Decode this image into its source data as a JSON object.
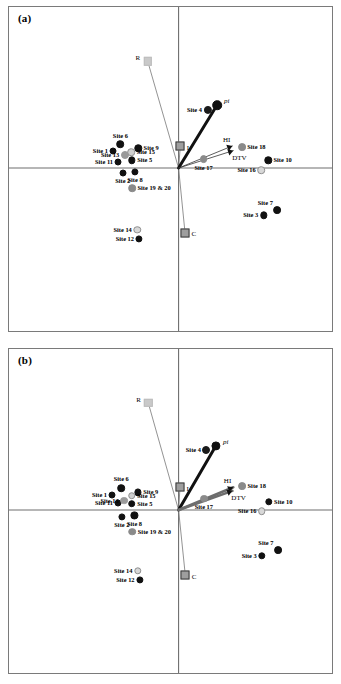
{
  "figure": {
    "type": "ordination-biplot-pair",
    "panels": [
      {
        "id": "a",
        "label": "(a)"
      },
      {
        "id": "b",
        "label": "(b)"
      }
    ]
  },
  "chart_data": [
    {
      "type": "scatter",
      "panel": "(a)",
      "title": "",
      "xlabel": "",
      "ylabel": "",
      "xlim": [
        -1,
        1
      ],
      "ylim": [
        -1,
        1
      ],
      "grid": false,
      "legend": "none",
      "axes": {
        "horizontal_axis_y": 0,
        "vertical_axis_x": 0,
        "cross_axes": true
      },
      "sites": [
        {
          "label": "Site 1",
          "x": -0.446,
          "y": 0.118,
          "fill": "#111111",
          "size": 7.0,
          "label_pos": "r"
        },
        {
          "label": "Site 2",
          "x": -0.38,
          "y": -0.032,
          "fill": "#111111",
          "size": 7.0,
          "label_pos": "below"
        },
        {
          "label": "Site 3",
          "x": 0.578,
          "y": -0.322,
          "fill": "#111111",
          "size": 7.4,
          "label_pos": "r"
        },
        {
          "label": "Site 4",
          "x": 0.198,
          "y": 0.392,
          "fill": "#1a1a1a",
          "size": 8.2,
          "label_pos": "r"
        },
        {
          "label": "Site 5",
          "x": -0.318,
          "y": 0.052,
          "fill": "#111111",
          "size": 7.4,
          "label_pos": "l"
        },
        {
          "label": "Site 6",
          "x": -0.396,
          "y": 0.16,
          "fill": "#111111",
          "size": 7.6,
          "label_pos": "above"
        },
        {
          "label": "Site 7",
          "x": 0.672,
          "y": -0.286,
          "fill": "#111111",
          "size": 7.8,
          "label_pos": "above-l"
        },
        {
          "label": "Site 8",
          "x": -0.296,
          "y": -0.026,
          "fill": "#111111",
          "size": 7.2,
          "label_pos": "below"
        },
        {
          "label": "Site 9",
          "x": -0.274,
          "y": 0.134,
          "fill": "#111111",
          "size": 7.4,
          "label_pos": "l"
        },
        {
          "label": "Site 10",
          "x": 0.61,
          "y": 0.052,
          "fill": "#111111",
          "size": 7.4,
          "label_pos": "l"
        },
        {
          "label": "Site 11",
          "x": -0.412,
          "y": 0.04,
          "fill": "#111111",
          "size": 7.0,
          "label_pos": "r"
        },
        {
          "label": "Site 12",
          "x": -0.268,
          "y": -0.48,
          "fill": "#111111",
          "size": 7.2,
          "label_pos": "r"
        },
        {
          "label": "Site 13",
          "x": -0.366,
          "y": 0.086,
          "fill": "#9a9a9a",
          "size": 8.0,
          "label_pos": "r"
        },
        {
          "label": "Site 14",
          "x": -0.282,
          "y": -0.42,
          "fill": "#d8d8d8",
          "size": 7.4,
          "label_pos": "r"
        },
        {
          "label": "Site 15",
          "x": -0.322,
          "y": 0.108,
          "fill": "#cfcfcf",
          "size": 7.6,
          "label_pos": "l"
        },
        {
          "label": "Site 16",
          "x": 0.562,
          "y": -0.014,
          "fill": "#d8d8d8",
          "size": 7.6,
          "label_pos": "r"
        },
        {
          "label": "Site 17",
          "x": 0.17,
          "y": 0.06,
          "fill": "#8a8a8a",
          "size": 7.8,
          "label_pos": "below"
        },
        {
          "label": "Site 18",
          "x": 0.43,
          "y": 0.142,
          "fill": "#8a8a8a",
          "size": 7.8,
          "label_pos": "l"
        },
        {
          "label": "Site 19 & 20",
          "x": -0.316,
          "y": -0.136,
          "fill": "#8a8a8a",
          "size": 7.6,
          "label_pos": "l"
        },
        {
          "label": "pi-site",
          "x": 0.262,
          "y": 0.428,
          "fill": "#111111",
          "size": 9.6,
          "label_pos": "none"
        }
      ],
      "vectors": [
        {
          "label": "R",
          "x": -0.21,
          "y": 0.724,
          "style": "thin-gray",
          "marker": "square-light",
          "label_pos": "l"
        },
        {
          "label": "I",
          "x": 0.012,
          "y": 0.148,
          "style": "thin-gray",
          "marker": "square-gray",
          "label_pos": "r"
        },
        {
          "label": "C",
          "x": 0.044,
          "y": -0.44,
          "style": "thin-gray",
          "marker": "square-gray",
          "label_pos": "r"
        },
        {
          "label": "pi",
          "x": 0.262,
          "y": 0.428,
          "style": "thick-black",
          "marker": "arrow",
          "label_pos": "r"
        },
        {
          "label": "HI",
          "x": 0.366,
          "y": 0.15,
          "style": "thin-black",
          "marker": "arrow",
          "label_pos": "above"
        },
        {
          "label": "DTV",
          "x": 0.372,
          "y": 0.118,
          "style": "thin-black",
          "marker": "arrow",
          "label_pos": "below-r"
        }
      ]
    },
    {
      "type": "scatter",
      "panel": "(b)",
      "title": "",
      "xlabel": "",
      "ylabel": "",
      "xlim": [
        -1,
        1
      ],
      "ylim": [
        -1,
        1
      ],
      "grid": false,
      "legend": "none",
      "axes": {
        "horizontal_axis_y": 0,
        "vertical_axis_x": 0,
        "cross_axes": true
      },
      "sites": [
        {
          "label": "Site 1",
          "x": -0.452,
          "y": 0.102,
          "fill": "#111111",
          "size": 7.0,
          "label_pos": "r"
        },
        {
          "label": "Site 2",
          "x": -0.386,
          "y": -0.046,
          "fill": "#111111",
          "size": 7.2,
          "label_pos": "below"
        },
        {
          "label": "Site 3",
          "x": 0.568,
          "y": -0.312,
          "fill": "#111111",
          "size": 7.4,
          "label_pos": "r"
        },
        {
          "label": "Site 4",
          "x": 0.19,
          "y": 0.41,
          "fill": "#1a1a1a",
          "size": 8.0,
          "label_pos": "r"
        },
        {
          "label": "Site 5",
          "x": -0.318,
          "y": 0.042,
          "fill": "#111111",
          "size": 7.6,
          "label_pos": "l"
        },
        {
          "label": "Site 6",
          "x": -0.39,
          "y": 0.15,
          "fill": "#111111",
          "size": 7.6,
          "label_pos": "above"
        },
        {
          "label": "Site 7",
          "x": 0.676,
          "y": -0.272,
          "fill": "#111111",
          "size": 7.8,
          "label_pos": "above-l"
        },
        {
          "label": "Site 8",
          "x": -0.3,
          "y": -0.036,
          "fill": "#111111",
          "size": 7.2,
          "label_pos": "below"
        },
        {
          "label": "Site 9",
          "x": -0.276,
          "y": 0.12,
          "fill": "#111111",
          "size": 7.2,
          "label_pos": "l"
        },
        {
          "label": "Site 10",
          "x": 0.614,
          "y": 0.056,
          "fill": "#111111",
          "size": 7.4,
          "label_pos": "l"
        },
        {
          "label": "Site 11",
          "x": -0.412,
          "y": 0.046,
          "fill": "#111111",
          "size": 7.0,
          "label_pos": "r"
        },
        {
          "label": "Site 12",
          "x": -0.264,
          "y": -0.472,
          "fill": "#111111",
          "size": 7.2,
          "label_pos": "r"
        },
        {
          "label": "Site 13",
          "x": -0.37,
          "y": 0.064,
          "fill": "#9a9a9a",
          "size": 7.8,
          "label_pos": "r"
        },
        {
          "label": "Site 14",
          "x": -0.278,
          "y": -0.414,
          "fill": "#d8d8d8",
          "size": 7.4,
          "label_pos": "r"
        },
        {
          "label": "Site 15",
          "x": -0.318,
          "y": 0.098,
          "fill": "#cfcfcf",
          "size": 7.6,
          "label_pos": "l"
        },
        {
          "label": "Site 16",
          "x": 0.566,
          "y": -0.008,
          "fill": "#d8d8d8",
          "size": 7.6,
          "label_pos": "r"
        },
        {
          "label": "Site 17",
          "x": 0.172,
          "y": 0.078,
          "fill": "#8a8a8a",
          "size": 7.8,
          "label_pos": "below"
        },
        {
          "label": "Site 18",
          "x": 0.432,
          "y": 0.16,
          "fill": "#8a8a8a",
          "size": 7.8,
          "label_pos": "l"
        },
        {
          "label": "Site 19 & 20",
          "x": -0.314,
          "y": -0.148,
          "fill": "#8a8a8a",
          "size": 7.6,
          "label_pos": "l"
        },
        {
          "label": "pi-site",
          "x": 0.254,
          "y": 0.436,
          "fill": "#111111",
          "size": 9.2,
          "label_pos": "none"
        }
      ],
      "vectors": [
        {
          "label": "R",
          "x": -0.206,
          "y": 0.726,
          "style": "thin-gray",
          "marker": "square-light",
          "label_pos": "l"
        },
        {
          "label": "I",
          "x": 0.01,
          "y": 0.156,
          "style": "thin-gray",
          "marker": "square-gray",
          "label_pos": "r"
        },
        {
          "label": "C",
          "x": 0.046,
          "y": -0.444,
          "style": "thin-gray",
          "marker": "square-gray",
          "label_pos": "r"
        },
        {
          "label": "pi",
          "x": 0.254,
          "y": 0.436,
          "style": "thick-black",
          "marker": "arrow",
          "label_pos": "r"
        },
        {
          "label": "HI",
          "x": 0.372,
          "y": 0.154,
          "style": "thick-gray",
          "marker": "arrow",
          "label_pos": "above"
        },
        {
          "label": "DTV",
          "x": 0.366,
          "y": 0.13,
          "style": "thick-gray",
          "marker": "arrow",
          "label_pos": "below-r"
        }
      ]
    }
  ],
  "colors": {
    "marker_black": "#111111",
    "marker_gray": "#8a8a8a",
    "marker_light": "#d8d8d8",
    "axis": "#6f6f6f",
    "frame": "#7a7a7a",
    "vector_black": "#111111",
    "vector_gray": "#777777",
    "square_light": "#c9c9c9",
    "square_gray": "#9e9e9e"
  }
}
